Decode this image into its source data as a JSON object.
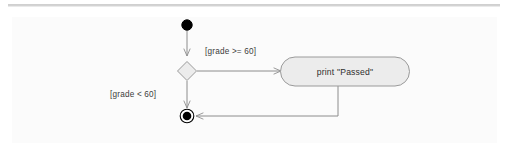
{
  "canvas": {
    "width": 512,
    "height": 143,
    "background_color": "#ffffff",
    "panel_color": "#fbfbfb",
    "rule_color": "#c6c6c6"
  },
  "diagram": {
    "type": "uml-activity-diagram",
    "title": "",
    "stroke_color": "#8c8c8c",
    "node_fill_color": "#ececec",
    "node_stroke_color": "#9a9a9a",
    "terminal_color": "#000000",
    "nodes": [
      {
        "id": "initial",
        "kind": "initial-node",
        "label": "",
        "x": 187,
        "y": 25,
        "r": 5.2
      },
      {
        "id": "decision",
        "kind": "decision-node",
        "label": "",
        "x": 187,
        "y": 71,
        "w": 19,
        "h": 19
      },
      {
        "id": "action-print-passed",
        "kind": "action-node",
        "label": "print \"Passed\"",
        "x": 280,
        "y": 57,
        "w": 130,
        "h": 29,
        "rx": 14.5
      },
      {
        "id": "final",
        "kind": "final-node",
        "label": "",
        "x": 187,
        "y": 116,
        "outer_r": 6.8,
        "inner_r": 4.3
      }
    ],
    "edges": [
      {
        "id": "edge-initial-to-decision",
        "from": "initial",
        "to": "decision",
        "guard": ""
      },
      {
        "id": "edge-decision-to-action",
        "from": "decision",
        "to": "action-print-passed",
        "guard": "[grade >= 60]"
      },
      {
        "id": "edge-decision-to-final",
        "from": "decision",
        "to": "final",
        "guard": "[grade < 60]"
      },
      {
        "id": "edge-action-to-final",
        "from": "action-print-passed",
        "to": "final",
        "guard": ""
      }
    ],
    "guards": {
      "pass_guard": "[grade >= 60]",
      "fail_guard": "[grade < 60]"
    },
    "action_label": "print \"Passed\""
  }
}
